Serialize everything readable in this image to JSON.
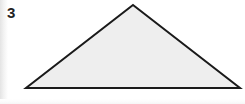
{
  "figure": {
    "problem_number": "3",
    "shape_name": "triangle",
    "shape_kind": "obtuse-scalene-triangle",
    "fill_color": "#eeeeee",
    "stroke_color": "#1a1a1a",
    "stroke_width": 2,
    "background_color": "#ffffff",
    "label_color": "#242424",
    "canvas": {
      "width": 245,
      "height": 104
    },
    "vertices": [
      {
        "name": "apex",
        "x": 133,
        "y": 5
      },
      {
        "name": "base-right",
        "x": 240,
        "y": 88
      },
      {
        "name": "base-left",
        "x": 26,
        "y": 88
      }
    ],
    "points_attr": "133,5 240,88 26,88"
  }
}
